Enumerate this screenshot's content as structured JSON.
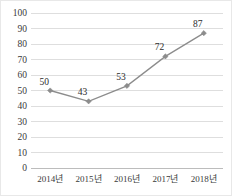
{
  "chart_data": {
    "type": "line",
    "title": "",
    "xlabel": "",
    "ylabel": "",
    "categories": [
      "2014년",
      "2015년",
      "2016년",
      "2017년",
      "2018년"
    ],
    "values": [
      50,
      43,
      53,
      72,
      87
    ],
    "point_labels": [
      "50",
      "43",
      "53",
      "72",
      "87"
    ],
    "ylim": [
      0,
      100
    ],
    "ytick_labels": [
      "100",
      "90",
      "80",
      "70",
      "60",
      "50",
      "40",
      "30",
      "20",
      "10",
      "0"
    ],
    "ytick_values": [
      100,
      90,
      80,
      70,
      60,
      50,
      40,
      30,
      20,
      10,
      0
    ],
    "grid": true,
    "legend": false,
    "legend_position": "none",
    "colors": {
      "line": "#8c8c8c",
      "marker": "#8c8c8c",
      "gridline": "#d6d6d6",
      "axis": "#b8b8b8",
      "text": "#3a3a3a",
      "background": "#ffffff",
      "border": "#e8e8e8"
    },
    "marker_shape": "diamond"
  }
}
